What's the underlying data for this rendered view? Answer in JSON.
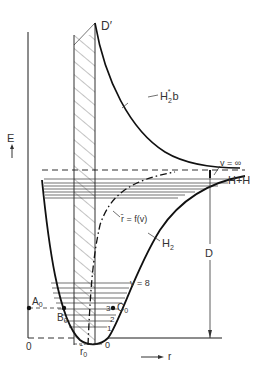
{
  "diagram": {
    "type": "potential-energy-curve",
    "y_axis": {
      "label": "E",
      "arrow": "up"
    },
    "x_axis": {
      "label": "r",
      "arrow": "right"
    },
    "origin_label": "0",
    "labels": {
      "d_prime": "D′",
      "excited_state": "H",
      "excited_state_sub": "2",
      "excited_state_sup": "*",
      "excited_state_suffix": "b",
      "v_infinity": "v = ∞",
      "dissociation_products": "H+H",
      "r_bar_function": "r̄ = f(v)",
      "ground_state": "H",
      "ground_state_sub": "2",
      "dissociation_energy": "D",
      "v8": "v = 8",
      "a0": "A",
      "a0_sub": "0",
      "b0": "B",
      "b0_sub": "0",
      "c0": "C",
      "c0_sub": "0",
      "level_3": "3",
      "level_2": "2",
      "level_1": "1",
      "level_0": "0",
      "r0": "r̄",
      "r0_sub": "0"
    },
    "colors": {
      "line": "#1a1a1a",
      "text": "#333333",
      "hatch": "#555555"
    }
  }
}
